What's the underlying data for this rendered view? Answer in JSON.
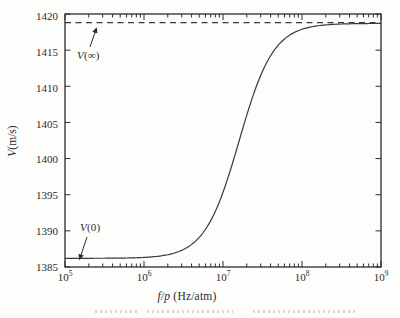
{
  "chart_data": {
    "type": "line",
    "title": "",
    "xlabel": "f/p (Hz/atm)",
    "xlabel_parts": {
      "f": "f",
      "slash": "/",
      "p": "p",
      "unit": " (Hz/atm)"
    },
    "ylabel": "V(m/s)",
    "ylabel_parts": {
      "var": "V",
      "unit": "(m/s)"
    },
    "x_scale": "log",
    "xlim": [
      100000,
      1000000000
    ],
    "ylim": [
      1385,
      1420
    ],
    "grid": false,
    "framed": true,
    "x_ticks": [
      {
        "base": "10",
        "exp": "5"
      },
      {
        "base": "10",
        "exp": "6"
      },
      {
        "base": "10",
        "exp": "7"
      },
      {
        "base": "10",
        "exp": "8"
      },
      {
        "base": "10",
        "exp": "9"
      }
    ],
    "x_tick_exponents": [
      5,
      6,
      7,
      8,
      9
    ],
    "y_tick_labels": [
      "1420",
      "1415",
      "1410",
      "1405",
      "1400",
      "1395",
      "1390",
      "1385"
    ],
    "y_tick_values": [
      1420,
      1415,
      1410,
      1405,
      1400,
      1395,
      1390,
      1385
    ],
    "series": [
      {
        "name": "sound-speed dispersion curve",
        "color": "#3a3a3a",
        "model": "V(f/p) = V0 + (Vinf - V0) * r^2/(1+r^2), r = (f/p)/fc",
        "V0": 1386.2,
        "Vinf": 1418.7,
        "fc": 16000000,
        "points": [
          [
            100000,
            1386.2
          ],
          [
            1000000,
            1386.3
          ],
          [
            3200000,
            1387.5
          ],
          [
            10000000,
            1395.3
          ],
          [
            16000000,
            1402.4
          ],
          [
            32000000,
            1412.0
          ],
          [
            100000000,
            1417.9
          ],
          [
            320000000,
            1418.6
          ],
          [
            1000000000,
            1418.7
          ]
        ]
      }
    ],
    "reference_line": {
      "value": 1418.8,
      "style": "dashed",
      "color": "#3a3a3a"
    },
    "annotations": [
      {
        "text": "V(∞)",
        "var": "V",
        "rest": "(∞)"
      },
      {
        "text": "V(0)",
        "var": "V",
        "rest": "(0)"
      }
    ]
  }
}
